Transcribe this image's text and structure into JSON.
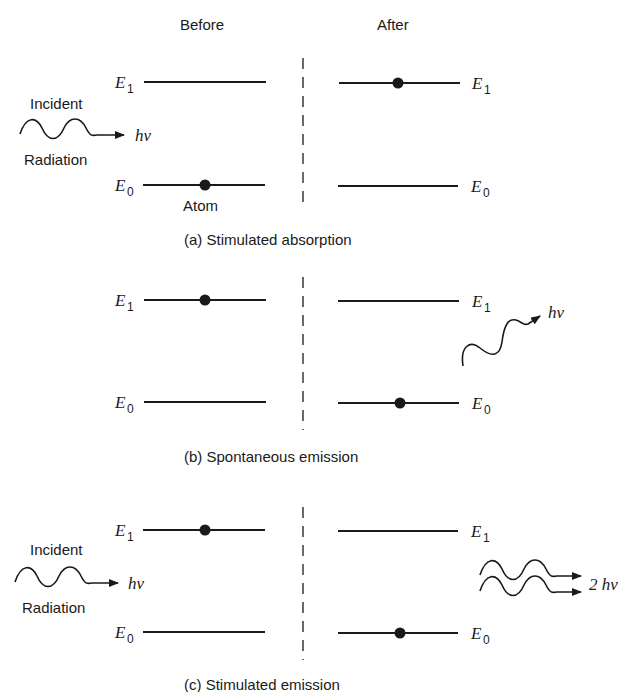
{
  "headers": {
    "before": "Before",
    "after": "After"
  },
  "levels": {
    "e1": "E",
    "e1_sub": "1",
    "e0": "E",
    "e0_sub": "0"
  },
  "photon": {
    "single": "hν",
    "double": "2 hν"
  },
  "labels": {
    "incident": "Incident",
    "radiation": "Radiation",
    "atom": "Atom"
  },
  "panels": [
    {
      "id": "a",
      "caption": "(a)  Stimulated absorption",
      "before_electron_level": "E0",
      "after_electron_level": "E1",
      "incident_photon": true,
      "emitted": "none"
    },
    {
      "id": "b",
      "caption": "(b)  Spontaneous emission",
      "before_electron_level": "E1",
      "after_electron_level": "E0",
      "incident_photon": false,
      "emitted": "hν"
    },
    {
      "id": "c",
      "caption": "(c)  Stimulated emission",
      "before_electron_level": "E1",
      "after_electron_level": "E0",
      "incident_photon": true,
      "emitted": "2 hν"
    }
  ],
  "colors": {
    "ink": "#1a1a1a",
    "background": "#ffffff"
  }
}
